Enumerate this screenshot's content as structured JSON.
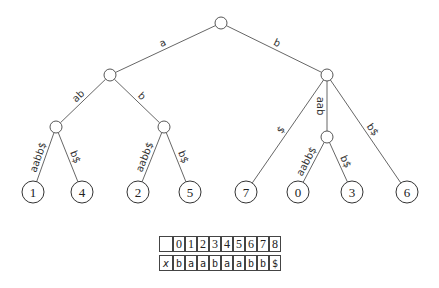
{
  "diagram": {
    "type": "suffix-tree",
    "nodes": {
      "root": {
        "x": 221,
        "y": 23
      },
      "n_a": {
        "x": 110,
        "y": 75
      },
      "n_b": {
        "x": 327,
        "y": 75
      },
      "n_aab": {
        "x": 56,
        "y": 127
      },
      "n_ab": {
        "x": 164,
        "y": 127
      },
      "n_baab": {
        "x": 327,
        "y": 137
      }
    },
    "leaves": [
      {
        "id": "leaf-1",
        "label": "1",
        "x": 33,
        "y": 192
      },
      {
        "id": "leaf-4",
        "label": "4",
        "x": 82,
        "y": 192
      },
      {
        "id": "leaf-2",
        "label": "2",
        "x": 138,
        "y": 192
      },
      {
        "id": "leaf-5",
        "label": "5",
        "x": 190,
        "y": 192
      },
      {
        "id": "leaf-7",
        "label": "7",
        "x": 246,
        "y": 192
      },
      {
        "id": "leaf-0",
        "label": "0",
        "x": 298,
        "y": 192
      },
      {
        "id": "leaf-3",
        "label": "3",
        "x": 352,
        "y": 192
      },
      {
        "id": "leaf-6",
        "label": "6",
        "x": 407,
        "y": 192
      }
    ],
    "edges": [
      {
        "from": "root",
        "to": "n_a",
        "label": "a"
      },
      {
        "from": "root",
        "to": "n_b",
        "label": "b"
      },
      {
        "from": "n_a",
        "to": "n_aab",
        "label": "ab"
      },
      {
        "from": "n_a",
        "to": "n_ab",
        "label": "b"
      },
      {
        "from": "n_aab",
        "to": "leaf-1",
        "label": "aabb$"
      },
      {
        "from": "n_aab",
        "to": "leaf-4",
        "label": "b$"
      },
      {
        "from": "n_ab",
        "to": "leaf-2",
        "label": "aabb$"
      },
      {
        "from": "n_ab",
        "to": "leaf-5",
        "label": "b$"
      },
      {
        "from": "n_b",
        "to": "leaf-7",
        "label": "$"
      },
      {
        "from": "n_b",
        "to": "n_baab",
        "label": "aab"
      },
      {
        "from": "n_b",
        "to": "leaf-6",
        "label": "b$"
      },
      {
        "from": "n_baab",
        "to": "leaf-0",
        "label": "aabb$"
      },
      {
        "from": "n_baab",
        "to": "leaf-3",
        "label": "b$"
      }
    ]
  },
  "array": {
    "header_blank": "",
    "indices": [
      "0",
      "1",
      "2",
      "3",
      "4",
      "5",
      "6",
      "7",
      "8"
    ],
    "row_label": "x",
    "values": [
      "b",
      "a",
      "a",
      "b",
      "a",
      "a",
      "b",
      "b",
      "$"
    ]
  }
}
